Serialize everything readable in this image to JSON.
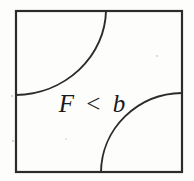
{
  "figure": {
    "title": "F < b",
    "background_color": "#fdfdfc",
    "line_color": "#2b2b2b",
    "text_color": "#1a1a1a",
    "label": {
      "lhs": "F",
      "operator": "<",
      "rhs": "b",
      "full_text": "F < b",
      "x": 92,
      "y": 112
    },
    "frame": {
      "name": "bounding-square",
      "left": 16,
      "top": 11,
      "right": 182,
      "bottom": 172,
      "stroke_width": 2.2
    },
    "arcs": [
      {
        "name": "upper-left-arc",
        "center_x": 16,
        "center_y": 11,
        "radius": 90,
        "start_x": 106,
        "start_y": 11,
        "end_x": 16,
        "end_y": 95,
        "stroke_width": 1.9,
        "path": "M 106 11 A 92 86 0 0 1 16 95"
      },
      {
        "name": "lower-right-arc",
        "center_x": 182,
        "center_y": 172,
        "radius": 82,
        "start_x": 182,
        "start_y": 93,
        "end_x": 101,
        "end_y": 172,
        "stroke_width": 1.9,
        "path": "M 182 93 A 82 80 0 0 0 101 172"
      }
    ],
    "specks": [
      {
        "x": 12,
        "y": 96,
        "r": 1.1
      },
      {
        "x": 157,
        "y": 56,
        "r": 0.9
      },
      {
        "x": 13,
        "y": 141,
        "r": 1.0
      },
      {
        "x": 66,
        "y": 139,
        "r": 0.8
      }
    ]
  }
}
